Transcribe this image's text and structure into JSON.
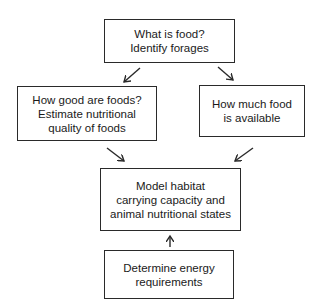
{
  "diagram": {
    "nodes": [
      {
        "id": "what-is-food",
        "lines": [
          "What is food?",
          "Identify forages"
        ]
      },
      {
        "id": "how-good",
        "lines": [
          "How good are foods?",
          "Estimate nutritional",
          "quality of foods"
        ]
      },
      {
        "id": "how-much",
        "lines": [
          "How much food",
          "is available"
        ]
      },
      {
        "id": "model-habitat",
        "lines": [
          "Model habitat",
          "carrying capacity and",
          "animal nutritional states"
        ]
      },
      {
        "id": "energy-requirements",
        "lines": [
          "Determine energy",
          "requirements"
        ]
      }
    ],
    "edges": [
      {
        "from": "what-is-food",
        "to": "how-good"
      },
      {
        "from": "what-is-food",
        "to": "how-much"
      },
      {
        "from": "how-good",
        "to": "model-habitat"
      },
      {
        "from": "how-much",
        "to": "model-habitat"
      },
      {
        "from": "energy-requirements",
        "to": "model-habitat"
      }
    ],
    "colors": {
      "line": "#2a2a2a",
      "background": "#ffffff",
      "text": "#1a1a1a"
    }
  }
}
